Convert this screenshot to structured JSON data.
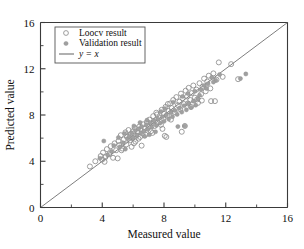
{
  "chart_data": {
    "type": "scatter",
    "title": "",
    "xlabel": "Measured value",
    "ylabel": "Predicted value",
    "xlim": [
      0,
      16
    ],
    "ylim": [
      0,
      16
    ],
    "xticks": [
      "0",
      "4",
      "8",
      "12",
      "16"
    ],
    "yticks": [
      "0",
      "4",
      "8",
      "12",
      "16"
    ],
    "xtick_values": [
      0,
      4,
      8,
      12,
      16
    ],
    "ytick_values": [
      0,
      4,
      8,
      12,
      16
    ],
    "minor_tick_step": 2,
    "grid": false,
    "legend_position": "upper-left-inside",
    "legend": [
      {
        "label": "Loocv result",
        "marker": "open-circle",
        "color": "#8c8c8c"
      },
      {
        "label": "Validation result",
        "marker": "filled-circle",
        "color": "#a0a0a0"
      },
      {
        "label": "y = x",
        "marker": "line",
        "color": "#6f6f6f"
      }
    ],
    "reference_line": {
      "label": "y = x",
      "slope": 1,
      "intercept": 0,
      "from": [
        0,
        0
      ],
      "to": [
        16,
        16
      ],
      "color": "#6f6f6f"
    },
    "series": [
      {
        "name": "Loocv result",
        "marker": "open-circle",
        "color": "#8c8c8c",
        "points": [
          [
            3.2,
            3.55
          ],
          [
            3.9,
            4.45
          ],
          [
            4.0,
            4.15
          ],
          [
            4.05,
            4.75
          ],
          [
            4.2,
            4.35
          ],
          [
            4.3,
            5.05
          ],
          [
            4.45,
            4.6
          ],
          [
            4.55,
            5.3
          ],
          [
            4.7,
            4.3
          ],
          [
            4.8,
            5.55
          ],
          [
            4.9,
            4.95
          ],
          [
            5.0,
            4.25
          ],
          [
            5.05,
            5.75
          ],
          [
            5.1,
            5.4
          ],
          [
            5.2,
            6.25
          ],
          [
            5.3,
            5.1
          ],
          [
            5.4,
            5.9
          ],
          [
            5.5,
            6.5
          ],
          [
            5.55,
            5.45
          ],
          [
            5.6,
            6.1
          ],
          [
            5.7,
            6.7
          ],
          [
            5.8,
            5.8
          ],
          [
            5.85,
            6.35
          ],
          [
            5.95,
            6.0
          ],
          [
            6.0,
            6.6
          ],
          [
            6.05,
            5.55
          ],
          [
            6.1,
            6.9
          ],
          [
            6.2,
            6.2
          ],
          [
            6.3,
            6.55
          ],
          [
            6.4,
            7.0
          ],
          [
            6.45,
            6.1
          ],
          [
            6.5,
            6.75
          ],
          [
            6.6,
            6.4
          ],
          [
            6.65,
            7.2
          ],
          [
            6.75,
            6.85
          ],
          [
            6.8,
            6.3
          ],
          [
            6.9,
            7.4
          ],
          [
            7.0,
            6.95
          ],
          [
            7.05,
            7.6
          ],
          [
            7.15,
            6.6
          ],
          [
            7.2,
            7.25
          ],
          [
            7.3,
            7.9
          ],
          [
            7.4,
            7.05
          ],
          [
            7.45,
            7.55
          ],
          [
            7.5,
            8.2
          ],
          [
            7.6,
            7.35
          ],
          [
            7.7,
            7.8
          ],
          [
            7.8,
            7.15
          ],
          [
            7.85,
            8.45
          ],
          [
            7.95,
            7.7
          ],
          [
            8.0,
            8.1
          ],
          [
            8.05,
            6.2
          ],
          [
            8.1,
            8.7
          ],
          [
            8.2,
            7.95
          ],
          [
            8.3,
            8.35
          ],
          [
            8.4,
            9.0
          ],
          [
            8.45,
            7.6
          ],
          [
            8.5,
            8.6
          ],
          [
            8.6,
            9.3
          ],
          [
            8.7,
            8.25
          ],
          [
            8.8,
            9.55
          ],
          [
            8.9,
            8.85
          ],
          [
            9.0,
            9.15
          ],
          [
            9.05,
            8.5
          ],
          [
            9.1,
            9.85
          ],
          [
            9.2,
            9.45
          ],
          [
            9.3,
            8.95
          ],
          [
            9.4,
            10.1
          ],
          [
            9.5,
            9.6
          ],
          [
            9.55,
            9.0
          ],
          [
            9.6,
            10.35
          ],
          [
            9.7,
            9.3
          ],
          [
            9.8,
            9.9
          ],
          [
            9.9,
            10.55
          ],
          [
            10.0,
            9.5
          ],
          [
            10.1,
            10.2
          ],
          [
            10.2,
            9.05
          ],
          [
            10.3,
            10.75
          ],
          [
            10.4,
            9.8
          ],
          [
            10.5,
            10.45
          ],
          [
            10.6,
            11.15
          ],
          [
            10.7,
            10.05
          ],
          [
            10.8,
            10.9
          ],
          [
            10.9,
            11.4
          ],
          [
            11.0,
            10.3
          ],
          [
            11.2,
            11.6
          ],
          [
            11.4,
            11.05
          ],
          [
            11.55,
            12.55
          ],
          [
            11.8,
            11.3
          ],
          [
            12.35,
            12.4
          ],
          [
            12.8,
            11.1
          ],
          [
            3.55,
            4.0
          ],
          [
            4.15,
            3.95
          ],
          [
            5.9,
            5.25
          ],
          [
            6.35,
            5.95
          ],
          [
            7.25,
            6.45
          ],
          [
            8.15,
            6.1
          ],
          [
            9.35,
            7.05
          ],
          [
            10.15,
            9.35
          ],
          [
            11.05,
            9.2
          ],
          [
            5.25,
            4.95
          ],
          [
            6.15,
            5.7
          ],
          [
            7.55,
            8.05
          ],
          [
            8.25,
            8.95
          ],
          [
            9.15,
            6.55
          ],
          [
            9.75,
            8.7
          ],
          [
            10.45,
            9.25
          ],
          [
            11.3,
            9.2
          ],
          [
            6.55,
            5.35
          ],
          [
            7.9,
            6.8
          ]
        ]
      },
      {
        "name": "Validation result",
        "marker": "filled-circle",
        "color": "#a0a0a0",
        "points": [
          [
            4.1,
            5.75
          ],
          [
            4.6,
            4.85
          ],
          [
            5.15,
            5.25
          ],
          [
            5.35,
            5.6
          ],
          [
            5.45,
            6.4
          ],
          [
            5.65,
            5.95
          ],
          [
            5.75,
            6.15
          ],
          [
            5.9,
            6.45
          ],
          [
            6.0,
            6.05
          ],
          [
            6.15,
            6.65
          ],
          [
            6.25,
            6.25
          ],
          [
            6.35,
            6.8
          ],
          [
            6.5,
            6.45
          ],
          [
            6.55,
            7.0
          ],
          [
            6.7,
            6.6
          ],
          [
            6.85,
            7.15
          ],
          [
            6.95,
            6.75
          ],
          [
            7.1,
            7.35
          ],
          [
            7.2,
            6.95
          ],
          [
            7.35,
            7.5
          ],
          [
            7.5,
            7.1
          ],
          [
            7.6,
            7.65
          ],
          [
            7.75,
            7.3
          ],
          [
            7.9,
            7.85
          ],
          [
            8.0,
            7.45
          ],
          [
            8.15,
            8.0
          ],
          [
            8.3,
            7.65
          ],
          [
            8.45,
            8.2
          ],
          [
            8.55,
            7.85
          ],
          [
            8.7,
            8.4
          ],
          [
            8.85,
            8.05
          ],
          [
            9.0,
            8.6
          ],
          [
            9.15,
            8.25
          ],
          [
            9.3,
            8.8
          ],
          [
            9.45,
            8.45
          ],
          [
            9.6,
            9.0
          ],
          [
            9.75,
            8.65
          ],
          [
            9.9,
            9.2
          ],
          [
            10.05,
            8.85
          ],
          [
            10.2,
            9.4
          ],
          [
            10.4,
            10.2
          ],
          [
            10.6,
            10.55
          ],
          [
            10.85,
            10.7
          ],
          [
            11.1,
            11.25
          ],
          [
            11.35,
            11.0
          ],
          [
            11.6,
            11.5
          ],
          [
            9.35,
            7.05
          ],
          [
            5.05,
            6.05
          ],
          [
            5.5,
            5.05
          ],
          [
            6.45,
            7.35
          ],
          [
            7.05,
            6.3
          ],
          [
            7.8,
            8.3
          ],
          [
            8.6,
            9.1
          ],
          [
            9.2,
            9.6
          ],
          [
            10.0,
            10.05
          ],
          [
            3.85,
            4.25
          ],
          [
            4.35,
            4.55
          ],
          [
            4.75,
            5.35
          ],
          [
            6.05,
            7.05
          ],
          [
            6.75,
            6.15
          ],
          [
            8.9,
            7.0
          ],
          [
            13.3,
            11.55
          ],
          [
            12.95,
            11.15
          ],
          [
            10.3,
            9.7
          ],
          [
            7.45,
            6.55
          ],
          [
            8.05,
            8.55
          ],
          [
            9.55,
            9.85
          ],
          [
            10.75,
            10.3
          ],
          [
            11.2,
            10.85
          ],
          [
            6.9,
            7.55
          ]
        ]
      }
    ]
  },
  "axes": {
    "x_title": "Measured value",
    "y_title": "Predicted value"
  }
}
